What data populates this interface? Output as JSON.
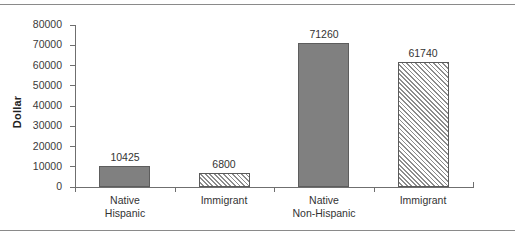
{
  "chart_data": {
    "type": "bar",
    "title": "",
    "xlabel": "",
    "ylabel": "Dollar",
    "ylim": [
      0,
      80000
    ],
    "grid": false,
    "legend": "none",
    "categories": [
      {
        "line1": "Native",
        "line2": "Hispanic"
      },
      {
        "line1": "Immigrant",
        "line2": ""
      },
      {
        "line1": "Native",
        "line2": "Non-Hispanic"
      },
      {
        "line1": "Immigrant",
        "line2": ""
      }
    ],
    "category_labels": [
      "Native Hispanic",
      "Immigrant",
      "Native Non-Hispanic",
      "Immigrant"
    ],
    "values": [
      10425,
      6800,
      71260,
      61740
    ],
    "value_labels": [
      "10425",
      "6800",
      "71260",
      "61740"
    ],
    "bar_styles": [
      "solid",
      "hatch",
      "solid",
      "hatch"
    ],
    "y_ticks": [
      0,
      10000,
      20000,
      30000,
      40000,
      50000,
      60000,
      70000,
      80000
    ],
    "y_tick_labels": [
      "0",
      "10000",
      "20000",
      "30000",
      "40000",
      "50000",
      "60000",
      "70000",
      "80000"
    ],
    "colors": {
      "solid_fill": "#808080",
      "solid_border": "#5d5d5d",
      "hatch_fill": "#ffffff",
      "hatch_line": "#8c8c8c",
      "hatch_border": "#5a5a5a",
      "axis": "#6f6f6f",
      "text": "#333333",
      "background": "#ffffff",
      "frame_rule": "#8a8a8a"
    }
  }
}
